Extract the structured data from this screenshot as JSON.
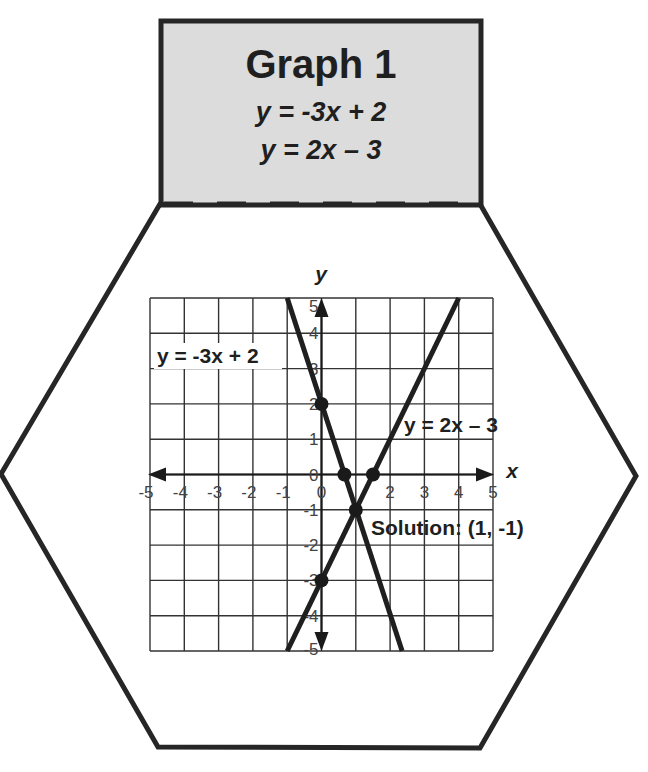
{
  "header": {
    "title": "Graph 1",
    "equation_1": "y = -3x + 2",
    "equation_2": "y = 2x – 3",
    "background": "#dcdcdc"
  },
  "graph": {
    "x_axis_label": "x",
    "y_axis_label": "y",
    "line_1_label": "y = -3x + 2",
    "line_2_label": "y = 2x – 3",
    "solution_label": "Solution: (1, -1)"
  },
  "chart_data": {
    "type": "line",
    "title": "Graph 1",
    "subtitle": [
      "y = -3x + 2",
      "y = 2x – 3"
    ],
    "xlabel": "x",
    "ylabel": "y",
    "xlim": [
      -5,
      5
    ],
    "ylim": [
      -5,
      5
    ],
    "grid": true,
    "x_ticks": [
      -5,
      -4,
      -3,
      -2,
      -1,
      0,
      1,
      2,
      3,
      4,
      5
    ],
    "y_ticks": [
      -5,
      -4,
      -3,
      -2,
      -1,
      0,
      1,
      2,
      3,
      4,
      5
    ],
    "series": [
      {
        "name": "y = -3x + 2",
        "slope": -3,
        "intercept": 2,
        "x": [
          1,
          2.3333
        ],
        "segment": [
          [
            1,
            5
          ],
          [
            2.3333,
            -5
          ]
        ],
        "marked_points": [
          [
            0,
            2
          ],
          [
            0.6667,
            0
          ],
          [
            1,
            -1
          ]
        ]
      },
      {
        "name": "y = 2x – 3",
        "slope": 2,
        "intercept": -3,
        "segment": [
          [
            -1,
            -5
          ],
          [
            4,
            5
          ]
        ],
        "marked_points": [
          [
            0,
            -3
          ],
          [
            1.5,
            0
          ],
          [
            1,
            -1
          ]
        ]
      }
    ],
    "annotations": [
      {
        "text": "y = -3x + 2",
        "near": [
          -3.5,
          3.5
        ]
      },
      {
        "text": "y = 2x – 3",
        "near": [
          3.3,
          1.5
        ]
      },
      {
        "text": "Solution: (1, -1)",
        "at": [
          1,
          -1
        ]
      }
    ],
    "solution": [
      1,
      -1
    ]
  }
}
